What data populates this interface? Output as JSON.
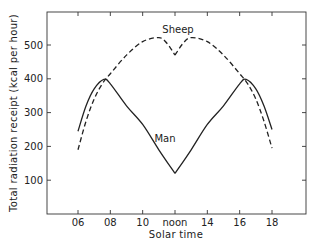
{
  "chart_data": {
    "type": "line",
    "title": "",
    "xlabel": "Solar time",
    "ylabel": "Total radiation receipt (kcal per hour)",
    "x_tick_labels": [
      "06",
      "08",
      "10",
      "noon",
      "14",
      "16",
      "18"
    ],
    "x_tick_values": [
      6,
      8,
      10,
      12,
      14,
      16,
      18
    ],
    "y_tick_labels": [
      "100",
      "200",
      "300",
      "400",
      "500"
    ],
    "y_tick_values": [
      100,
      200,
      300,
      400,
      500
    ],
    "xlim": [
      5,
      20
    ],
    "ylim": [
      0,
      600
    ],
    "grid": false,
    "legend": "inline labels",
    "series": [
      {
        "name": "Sheep",
        "style": "dashed",
        "x": [
          6.0,
          6.5,
          7.0,
          7.5,
          8.0,
          9.0,
          10.0,
          11.0,
          11.5,
          12.0,
          12.5,
          13.0,
          14.0,
          15.0,
          16.0,
          16.5,
          17.0,
          17.5,
          18.0
        ],
        "y": [
          190,
          275,
          340,
          385,
          415,
          470,
          510,
          522,
          505,
          470,
          505,
          522,
          510,
          470,
          415,
          385,
          340,
          275,
          195
        ]
      },
      {
        "name": "Man",
        "style": "solid",
        "x": [
          6.0,
          6.5,
          7.0,
          7.6,
          8.0,
          9.0,
          10.0,
          11.0,
          12.0,
          13.0,
          14.0,
          15.0,
          16.0,
          16.4,
          17.0,
          17.5,
          18.0
        ],
        "y": [
          245,
          320,
          370,
          398,
          385,
          320,
          265,
          190,
          120,
          190,
          265,
          320,
          385,
          398,
          370,
          320,
          250
        ]
      }
    ],
    "annotations": [
      {
        "text": "Sheep",
        "x": 12.0,
        "y": 545
      },
      {
        "text": "Man",
        "x": 11.3,
        "y": 235
      }
    ]
  },
  "labels": {
    "sheep": "Sheep",
    "man": "Man",
    "xlabel": "Solar time",
    "ylabel": "Total radiation receipt (kcal per hour)"
  }
}
